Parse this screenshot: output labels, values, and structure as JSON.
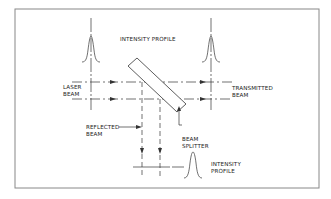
{
  "diagram": {
    "labels": {
      "intensity_profile_top": "INTENSITY PROFILE",
      "laser_beam_1": "LASER",
      "laser_beam_2": "BEAM",
      "transmitted_beam_1": "TRANSMITTED",
      "transmitted_beam_2": "BEAM",
      "reflected_beam_1": "REFLECTED",
      "reflected_beam_2": "BEAM",
      "beam_splitter_1": "BEAM",
      "beam_splitter_2": "SPLITTER",
      "intensity_profile_bottom_1": "INTENSITY",
      "intensity_profile_bottom_2": "PROFILE"
    },
    "colors": {
      "line": "#333333",
      "border": "#888888",
      "background": "#ffffff"
    }
  }
}
